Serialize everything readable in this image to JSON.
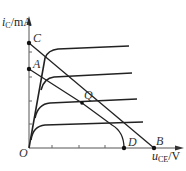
{
  "diagram": {
    "type": "transistor output characteristic with load lines",
    "axes": {
      "y_label": {
        "var": "i",
        "sub": "C",
        "unit": "/mA"
      },
      "x_label": {
        "var": "u",
        "sub": "CE",
        "unit": "/V"
      },
      "origin": "O"
    },
    "points": {
      "C": "C",
      "A": "A",
      "Q": "Q",
      "D": "D",
      "B": "B"
    },
    "colors": {
      "line": "#222222",
      "text": "#333333"
    }
  }
}
